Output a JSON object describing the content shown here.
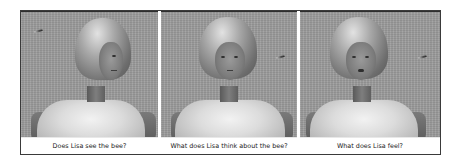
{
  "figure": {
    "panels": [
      {
        "id": "panel-1",
        "caption": "Does Lisa see the bee?",
        "character": "Lisa",
        "head_pose": "turned-right",
        "bee_position": "upper-left"
      },
      {
        "id": "panel-2",
        "caption": "What does Lisa think about the bee?",
        "character": "Lisa",
        "head_pose": "frontal",
        "bee_position": "right"
      },
      {
        "id": "panel-3",
        "caption": "What does Lisa feel?",
        "character": "Lisa",
        "head_pose": "frontal-mouth-open",
        "bee_position": "right"
      }
    ]
  },
  "colors": {
    "background": "#9c9c9c",
    "border": "#3a3a3a",
    "caption_bg": "#ffffff",
    "caption_text": "#1a1a1a"
  }
}
